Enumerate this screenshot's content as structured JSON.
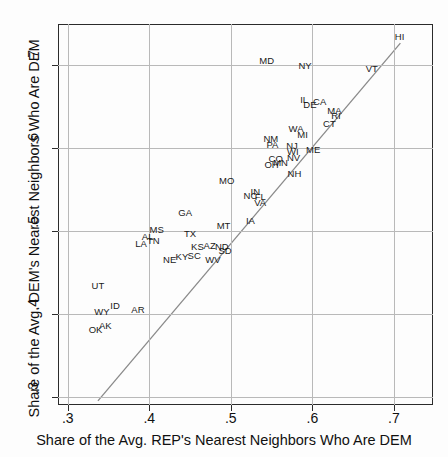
{
  "chart_data": {
    "type": "scatter",
    "title": "",
    "xlabel": "Share of the Avg. REP's Nearest Neighbors Who Are DEM",
    "ylabel": "Share of the Avg. DEM's Nearest Neighbors Who Are DEM",
    "xlim": [
      0.288,
      0.748
    ],
    "ylim": [
      0.29,
      0.749
    ],
    "xticks": [
      0.3,
      0.4,
      0.5,
      0.6,
      0.7
    ],
    "xticklabels": [
      ".3",
      ".4",
      ".5",
      ".6",
      ".7"
    ],
    "yticks": [
      0.3,
      0.4,
      0.5,
      0.6,
      0.7
    ],
    "yticklabels": [
      ".3",
      ".4",
      ".5",
      ".6",
      ".7"
    ],
    "grid": true,
    "legend": null,
    "point_style": "text-labels",
    "reference_line": {
      "type": "identity",
      "label": "45-degree line",
      "x": [
        0.337,
        0.708
      ],
      "y": [
        0.295,
        0.726
      ]
    },
    "points": [
      {
        "label": "HI",
        "x": 0.707,
        "y": 0.735
      },
      {
        "label": "VT",
        "x": 0.673,
        "y": 0.696
      },
      {
        "label": "NY",
        "x": 0.591,
        "y": 0.7
      },
      {
        "label": "MD",
        "x": 0.544,
        "y": 0.706
      },
      {
        "label": "IL",
        "x": 0.59,
        "y": 0.659
      },
      {
        "label": "DE",
        "x": 0.597,
        "y": 0.653
      },
      {
        "label": "CA",
        "x": 0.609,
        "y": 0.656
      },
      {
        "label": "MA",
        "x": 0.627,
        "y": 0.645
      },
      {
        "label": "RI",
        "x": 0.629,
        "y": 0.639
      },
      {
        "label": "CT",
        "x": 0.621,
        "y": 0.63
      },
      {
        "label": "WA",
        "x": 0.58,
        "y": 0.624
      },
      {
        "label": "MI",
        "x": 0.588,
        "y": 0.617
      },
      {
        "label": "NM",
        "x": 0.549,
        "y": 0.612
      },
      {
        "label": "PA",
        "x": 0.551,
        "y": 0.604
      },
      {
        "label": "NJ",
        "x": 0.575,
        "y": 0.603
      },
      {
        "label": "WI",
        "x": 0.576,
        "y": 0.596
      },
      {
        "label": "ME",
        "x": 0.601,
        "y": 0.598
      },
      {
        "label": "CO",
        "x": 0.555,
        "y": 0.588
      },
      {
        "label": "NV",
        "x": 0.577,
        "y": 0.589
      },
      {
        "label": "MN",
        "x": 0.561,
        "y": 0.583
      },
      {
        "label": "OH",
        "x": 0.55,
        "y": 0.58
      },
      {
        "label": "NH",
        "x": 0.578,
        "y": 0.569
      },
      {
        "label": "MO",
        "x": 0.495,
        "y": 0.561
      },
      {
        "label": "IN",
        "x": 0.53,
        "y": 0.548
      },
      {
        "label": "NC",
        "x": 0.524,
        "y": 0.543
      },
      {
        "label": "FL",
        "x": 0.536,
        "y": 0.542
      },
      {
        "label": "VA",
        "x": 0.536,
        "y": 0.534
      },
      {
        "label": "GA",
        "x": 0.444,
        "y": 0.523
      },
      {
        "label": "IA",
        "x": 0.524,
        "y": 0.513
      },
      {
        "label": "MT",
        "x": 0.491,
        "y": 0.507
      },
      {
        "label": "MS",
        "x": 0.409,
        "y": 0.502
      },
      {
        "label": "TX",
        "x": 0.45,
        "y": 0.497
      },
      {
        "label": "AL",
        "x": 0.398,
        "y": 0.493
      },
      {
        "label": "TN",
        "x": 0.405,
        "y": 0.489
      },
      {
        "label": "LA",
        "x": 0.39,
        "y": 0.485
      },
      {
        "label": "KS",
        "x": 0.459,
        "y": 0.482
      },
      {
        "label": "AZ",
        "x": 0.474,
        "y": 0.483
      },
      {
        "label": "ND",
        "x": 0.489,
        "y": 0.482
      },
      {
        "label": "SD",
        "x": 0.493,
        "y": 0.477
      },
      {
        "label": "KY",
        "x": 0.44,
        "y": 0.47
      },
      {
        "label": "SC",
        "x": 0.455,
        "y": 0.471
      },
      {
        "label": "NE",
        "x": 0.425,
        "y": 0.466
      },
      {
        "label": "WV",
        "x": 0.478,
        "y": 0.466
      },
      {
        "label": "UT",
        "x": 0.337,
        "y": 0.434
      },
      {
        "label": "ID",
        "x": 0.358,
        "y": 0.411
      },
      {
        "label": "AR",
        "x": 0.386,
        "y": 0.406
      },
      {
        "label": "WY",
        "x": 0.342,
        "y": 0.403
      },
      {
        "label": "AK",
        "x": 0.346,
        "y": 0.386
      },
      {
        "label": "OK",
        "x": 0.334,
        "y": 0.381
      }
    ]
  },
  "axis": {
    "x_title": "Share of the Avg. REP's Nearest Neighbors Who Are DEM",
    "y_title": "Share of the Avg. DEM's Nearest Neighbors Who Are DEM"
  },
  "colors": {
    "frame": "#2b2b2b",
    "grid": "#b9b9b9",
    "refline": "#8a8a8a",
    "text": "#111111",
    "background": "#fdfdfd"
  }
}
